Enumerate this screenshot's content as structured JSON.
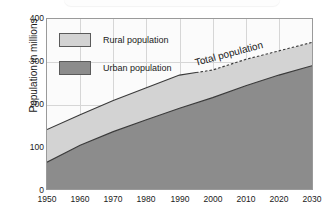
{
  "figure": {
    "background_color": "#ffffff",
    "plot_background_color": "#fbfbfb",
    "frame_color": "#9a9a9a",
    "grid_color": "#d6d6d6"
  },
  "legend": {
    "position": "inside-top-left",
    "items": [
      {
        "label": "Rural population",
        "color": "#d3d3d3",
        "swatch_name": "legend-swatch-rural"
      },
      {
        "label": "Urban population",
        "color": "#8c8c8c",
        "swatch_name": "legend-swatch-urban"
      }
    ]
  },
  "annotations": [
    {
      "text": "Total population",
      "name": "total-population-annotation"
    }
  ],
  "axes": {
    "ylabel": "Population in millions",
    "xlabel": "",
    "yticks": [
      "0",
      "100",
      "200",
      "300",
      "400"
    ],
    "xticks": [
      "1950",
      "1960",
      "1970",
      "1980",
      "1990",
      "2000",
      "2010",
      "2020",
      "2030"
    ]
  },
  "chart_data": {
    "type": "area",
    "title": "",
    "subtitle": "",
    "xlabel": "",
    "ylabel": "Population in millions",
    "xlim": [
      1950,
      2030
    ],
    "ylim": [
      0,
      400
    ],
    "xticks": [
      1950,
      1960,
      1970,
      1980,
      1990,
      2000,
      2010,
      2020,
      2030
    ],
    "yticks": [
      0,
      100,
      200,
      300,
      400
    ],
    "grid": true,
    "legend_position": "inside upper left",
    "stacked": true,
    "x": [
      1950,
      1960,
      1970,
      1980,
      1990,
      2000,
      2010,
      2020,
      2030
    ],
    "series": [
      {
        "name": "Urban population",
        "color": "#8c8c8c",
        "values": [
          63,
          103,
          135,
          163,
          190,
          215,
          243,
          268,
          290
        ]
      },
      {
        "name": "Rural population",
        "color": "#d3d3d3",
        "note": "band between urban and total",
        "values": [
          77,
          72,
          73,
          75,
          78,
          65,
          62,
          57,
          55
        ]
      }
    ],
    "total_line": {
      "name": "Total population",
      "color": "#3a3a3a",
      "values": [
        140,
        175,
        208,
        238,
        268,
        280,
        305,
        325,
        345
      ],
      "solid_until": 1995,
      "dashed_after": 1995
    },
    "annotations": [
      {
        "text": "Total population",
        "x": 1998,
        "y": 310,
        "rotation": -15
      }
    ]
  }
}
